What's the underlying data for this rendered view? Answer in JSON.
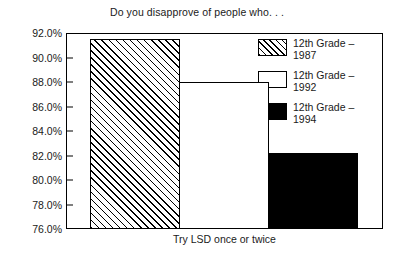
{
  "chart_data": {
    "type": "bar",
    "title": "Do you disapprove of people who. . .",
    "xlabel": "Try LSD once or twice",
    "ylabel": "",
    "categories": [
      "Try LSD once or twice"
    ],
    "ylim": [
      76.0,
      92.0
    ],
    "ytick_labels": [
      "92.0%",
      "90.0%",
      "88.0%",
      "86.0%",
      "84.0%",
      "82.0%",
      "80.0%",
      "78.0%",
      "76.0%"
    ],
    "ytick_values": [
      92.0,
      90.0,
      88.0,
      86.0,
      84.0,
      82.0,
      80.0,
      78.0,
      76.0
    ],
    "grid": false,
    "legend_position": "top-right",
    "series": [
      {
        "name": "12th Grade – 1987",
        "name_line1": "12th Grade –",
        "name_line2": "1987",
        "values": [
          91.5
        ],
        "fill": "hatched"
      },
      {
        "name": "12th Grade – 1992",
        "name_line1": "12th Grade –",
        "name_line2": "1992",
        "values": [
          88.0
        ],
        "fill": "outline"
      },
      {
        "name": "12th Grade – 1994",
        "name_line1": "12th Grade –",
        "name_line2": "1994",
        "values": [
          82.2
        ],
        "fill": "solid"
      }
    ]
  },
  "colors": {
    "ink": "#000000",
    "text": "#1a1a1a",
    "background": "#ffffff"
  }
}
